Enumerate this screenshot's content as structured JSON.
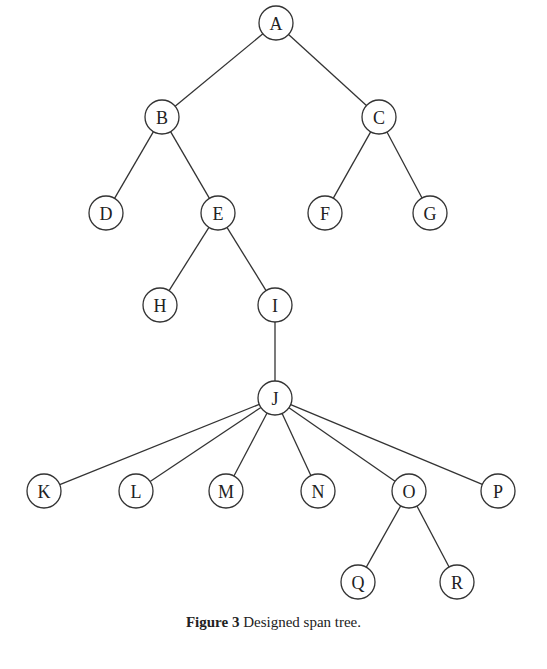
{
  "diagram": {
    "type": "tree",
    "node_radius": 17,
    "stroke_color": "#333333",
    "nodes": [
      {
        "id": "A",
        "x": 276,
        "y": 23
      },
      {
        "id": "B",
        "x": 162,
        "y": 117
      },
      {
        "id": "C",
        "x": 379,
        "y": 117
      },
      {
        "id": "D",
        "x": 106,
        "y": 213
      },
      {
        "id": "E",
        "x": 218,
        "y": 213
      },
      {
        "id": "F",
        "x": 325,
        "y": 213
      },
      {
        "id": "G",
        "x": 430,
        "y": 213
      },
      {
        "id": "H",
        "x": 160,
        "y": 305
      },
      {
        "id": "I",
        "x": 275,
        "y": 305
      },
      {
        "id": "J",
        "x": 275,
        "y": 398
      },
      {
        "id": "K",
        "x": 44,
        "y": 491
      },
      {
        "id": "L",
        "x": 136,
        "y": 491
      },
      {
        "id": "M",
        "x": 226,
        "y": 491
      },
      {
        "id": "N",
        "x": 318,
        "y": 491
      },
      {
        "id": "O",
        "x": 409,
        "y": 491
      },
      {
        "id": "P",
        "x": 498,
        "y": 491
      },
      {
        "id": "Q",
        "x": 358,
        "y": 582
      },
      {
        "id": "R",
        "x": 457,
        "y": 582
      }
    ],
    "edges": [
      [
        "A",
        "B"
      ],
      [
        "A",
        "C"
      ],
      [
        "B",
        "D"
      ],
      [
        "B",
        "E"
      ],
      [
        "C",
        "F"
      ],
      [
        "C",
        "G"
      ],
      [
        "E",
        "H"
      ],
      [
        "E",
        "I"
      ],
      [
        "I",
        "J"
      ],
      [
        "J",
        "K"
      ],
      [
        "J",
        "L"
      ],
      [
        "J",
        "M"
      ],
      [
        "J",
        "N"
      ],
      [
        "J",
        "O"
      ],
      [
        "J",
        "P"
      ],
      [
        "O",
        "Q"
      ],
      [
        "O",
        "R"
      ]
    ]
  },
  "caption": {
    "label": "Figure 3",
    "text": "Designed span tree."
  }
}
